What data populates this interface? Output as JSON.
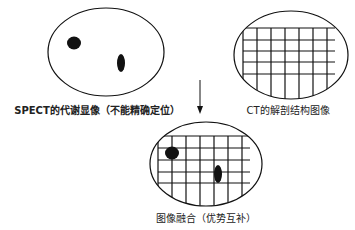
{
  "diagram": {
    "spect": {
      "label": "SPECT的代谢显像（不能精确定位）"
    },
    "ct": {
      "label": "CT的解剖结构图像"
    },
    "fusion": {
      "label": "图像融合（优势互补）"
    },
    "arrow": "down-arrow",
    "colors": {
      "stroke": "#111111",
      "background": "#ffffff"
    }
  }
}
